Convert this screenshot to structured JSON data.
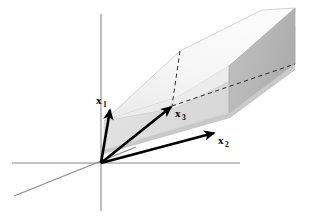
{
  "figure": {
    "background_color": "#ffffff",
    "canvas": {
      "width": 309,
      "height": 222
    },
    "origin": {
      "x": 101,
      "y": 163
    }
  },
  "axes": {
    "color": "#8a8a8a",
    "stroke_width": 1.1,
    "items": [
      {
        "name": "vertical-axis",
        "x1": 101,
        "y1": 14,
        "x2": 101,
        "y2": 211
      },
      {
        "name": "horizontal-axis",
        "x1": 12,
        "y1": 163,
        "x2": 240,
        "y2": 163
      },
      {
        "name": "depth-axis",
        "x1": 14,
        "y1": 196,
        "x2": 136,
        "y2": 147
      }
    ]
  },
  "solid": {
    "name": "spanned-plane-slab",
    "top_face_color": "#f6f6f6",
    "front_face_color": "#dedede",
    "front_face_upper_color": "#ededed",
    "end_face_color": "#b6b6b6",
    "edge_color": "#9a9a9a",
    "top_face_points": "104,121 180,51 262,10 295,8 295,13 229,66 178,97",
    "front_upper_points": "104,121 178,97 229,66 295,13 295,26 232,80 176,108",
    "front_face_points": "104,121 176,108 232,80 295,26 295,64 229,113 104,150",
    "end_face_points": "295,8 295,64 229,113 229,66",
    "bottom_shadow_points": "104,150 229,113 295,64 295,70 230,118 104,154"
  },
  "dashed_lines": {
    "color": "#2b2b2b",
    "items": [
      {
        "name": "vertical-dashed-line",
        "x1": 180,
        "y1": 51,
        "x2": 172,
        "y2": 106
      },
      {
        "name": "horizontal-dashed-line",
        "x1": 172,
        "y1": 106,
        "x2": 295,
        "y2": 64
      }
    ]
  },
  "vectors": {
    "color": "#000000",
    "stroke_width": 2.6,
    "items": [
      {
        "name": "vector-x1",
        "label": "x",
        "subscript": "1",
        "x1": 101,
        "y1": 163,
        "x2": 110,
        "y2": 110,
        "label_x": 96,
        "label_y": 104,
        "sub_dx": 6.5,
        "sub_dy": 3
      },
      {
        "name": "vector-x3",
        "label": "x",
        "subscript": "3",
        "x1": 101,
        "y1": 163,
        "x2": 171,
        "y2": 107,
        "label_x": 175,
        "label_y": 117,
        "sub_dx": 6.5,
        "sub_dy": 3
      },
      {
        "name": "vector-x2",
        "label": "x",
        "subscript": "2",
        "x1": 101,
        "y1": 163,
        "x2": 214,
        "y2": 133,
        "label_x": 218,
        "label_y": 144,
        "sub_dx": 6.5,
        "sub_dy": 3
      }
    ]
  }
}
